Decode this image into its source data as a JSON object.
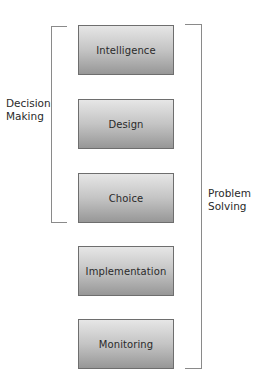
{
  "diagram": {
    "stages": [
      {
        "label": "Intelligence"
      },
      {
        "label": "Design"
      },
      {
        "label": "Choice"
      },
      {
        "label": "Implementation"
      },
      {
        "label": "Monitoring"
      }
    ],
    "brackets": {
      "left": {
        "line1": "Decision",
        "line2": "Making",
        "spans": [
          "Intelligence",
          "Design",
          "Choice"
        ]
      },
      "right": {
        "line1": "Problem",
        "line2": "Solving",
        "spans": [
          "Intelligence",
          "Design",
          "Choice",
          "Implementation",
          "Monitoring"
        ]
      }
    },
    "colors": {
      "box_top": "#e6e6e6",
      "box_bottom": "#979797",
      "box_border": "#6e6e6e",
      "bracket": "#8a8a8a"
    }
  }
}
